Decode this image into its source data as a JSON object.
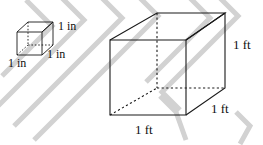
{
  "figure": {
    "background_color": "#ffffff",
    "line_color": "#1a1a1a",
    "watermark_color": "#d2d2d2",
    "small_cube": {
      "name": "cubic-inch-cube",
      "labels": {
        "depth": "1 in",
        "height": "1 in",
        "width": "1 in"
      }
    },
    "large_cube": {
      "name": "cubic-foot-cube",
      "labels": {
        "height": "1 ft",
        "depth": "1 ft",
        "width": "1 ft"
      }
    }
  }
}
